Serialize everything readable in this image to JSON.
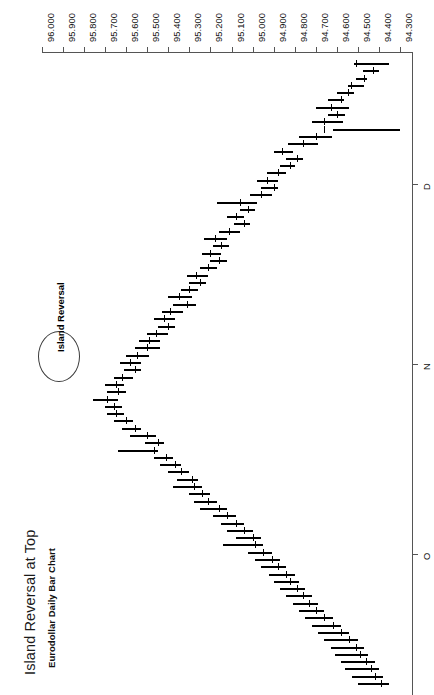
{
  "chart": {
    "title": "Island Reversal at Top",
    "subtitle": "Eurodollar Daily Bar Chart",
    "orientation": "rotated-90-clockwise"
  },
  "annotation": {
    "label": "Island Reversal",
    "marker": "ellipse"
  },
  "chart_data": {
    "type": "bar",
    "chart_subtype": "ohlc-high-low-close-bar",
    "title": "Island Reversal at Top",
    "subtitle": "Eurodollar Daily Bar Chart",
    "xlabel": "",
    "ylabel": "",
    "grid": false,
    "legend": null,
    "y_axis": {
      "position": "top-of-rotated-image",
      "ticks": [
        "96.000",
        "95.900",
        "95.800",
        "95.700",
        "95.600",
        "95.500",
        "95.400",
        "95.300",
        "95.200",
        "95.100",
        "95.000",
        "94.900",
        "94.800",
        "94.700",
        "94.600",
        "94.500",
        "94.400",
        "94.300"
      ],
      "values": [
        96.0,
        95.9,
        95.8,
        95.7,
        95.6,
        95.5,
        95.4,
        95.3,
        95.2,
        95.1,
        95.0,
        94.9,
        94.8,
        94.7,
        94.6,
        94.5,
        94.4,
        94.3
      ],
      "ylim": [
        94.3,
        96.0
      ],
      "direction": "descending-left-to-right"
    },
    "x_axis": {
      "position": "right-of-rotated-image",
      "ticks": [
        "D",
        "N",
        "O"
      ],
      "tick_positions_pct": [
        20.5,
        48.5,
        78.0
      ],
      "label_names": [
        "December",
        "November",
        "October"
      ],
      "direction": "latest-at-top"
    },
    "annotations": [
      {
        "text": "Island Reversal",
        "type": "ellipse-callout",
        "target_value": 95.69,
        "target_index": 46
      }
    ],
    "series": [
      {
        "name": "Eurodollar daily bars",
        "fields": [
          "high",
          "low",
          "close"
        ],
        "bars": [
          {
            "i": 0,
            "high": 94.52,
            "low": 94.35,
            "close": 94.51
          },
          {
            "i": 1,
            "high": 94.475,
            "low": 94.4,
            "close": 94.43
          },
          {
            "i": 2,
            "high": 94.51,
            "low": 94.455,
            "close": 94.47
          },
          {
            "i": 3,
            "high": 94.545,
            "low": 94.47,
            "close": 94.535
          },
          {
            "i": 4,
            "high": 94.6,
            "low": 94.52,
            "close": 94.545
          },
          {
            "i": 5,
            "high": 94.64,
            "low": 94.565,
            "close": 94.58
          },
          {
            "i": 6,
            "high": 94.7,
            "low": 94.54,
            "close": 94.63
          },
          {
            "i": 7,
            "high": 94.64,
            "low": 94.56,
            "close": 94.6
          },
          {
            "i": 8,
            "high": 94.72,
            "low": 94.57,
            "close": 94.66
          },
          {
            "i": 9,
            "high": 94.3,
            "low": 94.62,
            "close": 94.66
          },
          {
            "i": 10,
            "high": 94.78,
            "low": 94.625,
            "close": 94.7
          },
          {
            "i": 11,
            "high": 94.83,
            "low": 94.69,
            "close": 94.76
          },
          {
            "i": 12,
            "high": 94.9,
            "low": 94.81,
            "close": 94.86
          },
          {
            "i": 13,
            "high": 94.84,
            "low": 94.76,
            "close": 94.79
          },
          {
            "i": 14,
            "high": 94.87,
            "low": 94.8,
            "close": 94.82
          },
          {
            "i": 15,
            "high": 94.93,
            "low": 94.84,
            "close": 94.88
          },
          {
            "i": 16,
            "high": 94.98,
            "low": 94.88,
            "close": 94.93
          },
          {
            "i": 17,
            "high": 94.96,
            "low": 94.88,
            "close": 94.9
          },
          {
            "i": 18,
            "high": 95.01,
            "low": 94.91,
            "close": 94.96
          },
          {
            "i": 19,
            "high": 95.17,
            "low": 94.98,
            "close": 95.06
          },
          {
            "i": 20,
            "high": 95.06,
            "low": 94.99,
            "close": 95.02
          },
          {
            "i": 21,
            "high": 95.12,
            "low": 95.04,
            "close": 95.08
          },
          {
            "i": 22,
            "high": 95.09,
            "low": 95.01,
            "close": 95.04
          },
          {
            "i": 23,
            "high": 95.16,
            "low": 95.06,
            "close": 95.11
          },
          {
            "i": 24,
            "high": 95.23,
            "low": 95.12,
            "close": 95.18
          },
          {
            "i": 25,
            "high": 95.19,
            "low": 95.11,
            "close": 95.15
          },
          {
            "i": 26,
            "high": 95.24,
            "low": 95.15,
            "close": 95.2
          },
          {
            "i": 27,
            "high": 95.2,
            "low": 95.12,
            "close": 95.16
          },
          {
            "i": 28,
            "high": 95.25,
            "low": 95.17,
            "close": 95.21
          },
          {
            "i": 29,
            "high": 95.31,
            "low": 95.21,
            "close": 95.27
          },
          {
            "i": 30,
            "high": 95.3,
            "low": 95.22,
            "close": 95.25
          },
          {
            "i": 31,
            "high": 95.34,
            "low": 95.26,
            "close": 95.3
          },
          {
            "i": 32,
            "high": 95.4,
            "low": 95.29,
            "close": 95.35
          },
          {
            "i": 33,
            "high": 95.38,
            "low": 95.27,
            "close": 95.31
          },
          {
            "i": 34,
            "high": 95.43,
            "low": 95.33,
            "close": 95.39
          },
          {
            "i": 35,
            "high": 95.47,
            "low": 95.37,
            "close": 95.42
          },
          {
            "i": 36,
            "high": 95.45,
            "low": 95.37,
            "close": 95.4
          },
          {
            "i": 37,
            "high": 95.5,
            "low": 95.4,
            "close": 95.46
          },
          {
            "i": 38,
            "high": 95.54,
            "low": 95.44,
            "close": 95.49
          },
          {
            "i": 39,
            "high": 95.56,
            "low": 95.44,
            "close": 95.5
          },
          {
            "i": 40,
            "high": 95.6,
            "low": 95.49,
            "close": 95.55
          },
          {
            "i": 41,
            "high": 95.63,
            "low": 95.53,
            "close": 95.58
          },
          {
            "i": 42,
            "high": 95.61,
            "low": 95.53,
            "close": 95.56
          },
          {
            "i": 43,
            "high": 95.66,
            "low": 95.57,
            "close": 95.62
          },
          {
            "i": 44,
            "high": 95.7,
            "low": 95.61,
            "close": 95.65
          },
          {
            "i": 45,
            "high": 95.69,
            "low": 95.6,
            "close": 95.64
          },
          {
            "i": 46,
            "high": 95.76,
            "low": 95.64,
            "close": 95.69
          },
          {
            "i": 47,
            "high": 95.7,
            "low": 95.62,
            "close": 95.66
          },
          {
            "i": 48,
            "high": 95.69,
            "low": 95.61,
            "close": 95.65
          },
          {
            "i": 49,
            "high": 95.66,
            "low": 95.57,
            "close": 95.6
          },
          {
            "i": 50,
            "high": 95.62,
            "low": 95.53,
            "close": 95.56
          },
          {
            "i": 51,
            "high": 95.58,
            "low": 95.46,
            "close": 95.5
          },
          {
            "i": 52,
            "high": 95.51,
            "low": 95.42,
            "close": 95.45
          },
          {
            "i": 53,
            "high": 95.64,
            "low": 95.45,
            "close": 95.47
          },
          {
            "i": 54,
            "high": 95.47,
            "low": 95.38,
            "close": 95.41
          },
          {
            "i": 55,
            "high": 95.44,
            "low": 95.34,
            "close": 95.37
          },
          {
            "i": 56,
            "high": 95.4,
            "low": 95.3,
            "close": 95.34
          },
          {
            "i": 57,
            "high": 95.36,
            "low": 95.26,
            "close": 95.29
          },
          {
            "i": 58,
            "high": 95.38,
            "low": 95.24,
            "close": 95.28
          },
          {
            "i": 59,
            "high": 95.3,
            "low": 95.2,
            "close": 95.24
          },
          {
            "i": 60,
            "high": 95.28,
            "low": 95.17,
            "close": 95.21
          },
          {
            "i": 61,
            "high": 95.25,
            "low": 95.12,
            "close": 95.16
          },
          {
            "i": 62,
            "high": 95.19,
            "low": 95.08,
            "close": 95.12
          },
          {
            "i": 63,
            "high": 95.15,
            "low": 95.04,
            "close": 95.08
          },
          {
            "i": 64,
            "high": 95.12,
            "low": 95.0,
            "close": 95.04
          },
          {
            "i": 65,
            "high": 95.08,
            "low": 94.96,
            "close": 95.0
          },
          {
            "i": 66,
            "high": 95.14,
            "low": 94.95,
            "close": 94.99
          },
          {
            "i": 67,
            "high": 95.02,
            "low": 94.91,
            "close": 94.95
          },
          {
            "i": 68,
            "high": 94.99,
            "low": 94.87,
            "close": 94.91
          },
          {
            "i": 69,
            "high": 94.96,
            "low": 94.84,
            "close": 94.88
          },
          {
            "i": 70,
            "high": 94.92,
            "low": 94.8,
            "close": 94.84
          },
          {
            "i": 71,
            "high": 94.9,
            "low": 94.78,
            "close": 94.82
          },
          {
            "i": 72,
            "high": 94.87,
            "low": 94.75,
            "close": 94.79
          },
          {
            "i": 73,
            "high": 94.84,
            "low": 94.72,
            "close": 94.76
          },
          {
            "i": 74,
            "high": 94.81,
            "low": 94.69,
            "close": 94.73
          },
          {
            "i": 75,
            "high": 94.78,
            "low": 94.66,
            "close": 94.7
          },
          {
            "i": 76,
            "high": 94.75,
            "low": 94.62,
            "close": 94.66
          },
          {
            "i": 77,
            "high": 94.72,
            "low": 94.58,
            "close": 94.62
          },
          {
            "i": 78,
            "high": 94.69,
            "low": 94.54,
            "close": 94.58
          },
          {
            "i": 79,
            "high": 94.66,
            "low": 94.5,
            "close": 94.54
          },
          {
            "i": 80,
            "high": 94.63,
            "low": 94.47,
            "close": 94.51
          },
          {
            "i": 81,
            "high": 94.61,
            "low": 94.45,
            "close": 94.49
          },
          {
            "i": 82,
            "high": 94.58,
            "low": 94.42,
            "close": 94.46
          },
          {
            "i": 83,
            "high": 94.56,
            "low": 94.4,
            "close": 94.44
          },
          {
            "i": 84,
            "high": 94.53,
            "low": 94.38,
            "close": 94.42
          },
          {
            "i": 85,
            "high": 94.5,
            "low": 94.35,
            "close": 94.39
          }
        ]
      }
    ]
  }
}
